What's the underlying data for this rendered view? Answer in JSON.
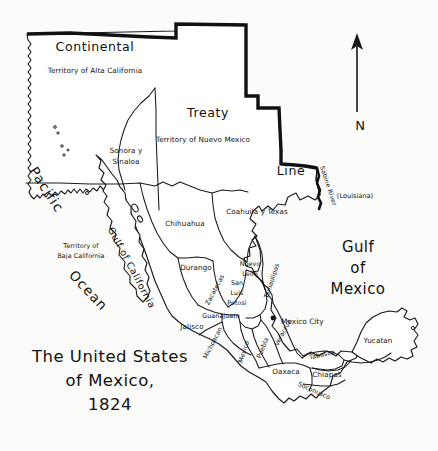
{
  "map": {
    "title_line1": "The United States",
    "title_line2": "of Mexico,",
    "title_year": "1824",
    "background_color": "#fbfbf9",
    "ink_color": "#111111",
    "land_fill": "#ffffff"
  },
  "compass": {
    "label": "N",
    "icon": "north-arrow-icon"
  },
  "boundary_labels": [
    {
      "id": "continental",
      "text": "Continental",
      "x": 95,
      "y": 47
    },
    {
      "id": "treaty",
      "text": "Treaty",
      "x": 208,
      "y": 113
    },
    {
      "id": "line",
      "text": "Line",
      "x": 291,
      "y": 171
    }
  ],
  "water_labels": [
    {
      "id": "pacific",
      "text": "Pacific",
      "x": 46,
      "y": 190,
      "rotate": 57
    },
    {
      "id": "ocean",
      "text": "Ocean",
      "x": 88,
      "y": 291,
      "rotate": 47
    },
    {
      "id": "gulf-of-california",
      "text": "Gulf of California",
      "x": 131,
      "y": 268,
      "rotate": 62
    },
    {
      "id": "gulf-of-mexico-1",
      "text": "Gulf",
      "x": 358,
      "y": 247
    },
    {
      "id": "gulf-of-mexico-2",
      "text": "of",
      "x": 358,
      "y": 267
    },
    {
      "id": "gulf-of-mexico-3",
      "text": "Mexico",
      "x": 358,
      "y": 288
    },
    {
      "id": "sabine-river",
      "text": "Sabine River",
      "x": 326,
      "y": 186,
      "rotate": 72
    }
  ],
  "territories": [
    {
      "id": "alta-california",
      "line1": "Territory of Alta California",
      "x": 95,
      "y": 71
    },
    {
      "id": "nuevo-mexico",
      "line1": "Territory of Nuevo Mexico",
      "x": 203,
      "y": 140
    },
    {
      "id": "baja-california",
      "line1": "Territory of",
      "line2": "Baja California",
      "x": 81,
      "y": 250
    }
  ],
  "states": [
    {
      "id": "sonora-sinaloa",
      "line1": "Sonora y",
      "line2": "Sinaloa",
      "x": 126,
      "y": 155,
      "rotate": 0
    },
    {
      "id": "chihuahua",
      "line1": "Chihuahua",
      "x": 185,
      "y": 224,
      "rotate": 0
    },
    {
      "id": "coahuila-texas",
      "line1": "Coahuila y Texas",
      "x": 257,
      "y": 212,
      "rotate": 0
    },
    {
      "id": "durango",
      "line1": "Durango",
      "x": 196,
      "y": 268,
      "rotate": 0
    },
    {
      "id": "zacatecas",
      "line1": "Zacatecas",
      "x": 215,
      "y": 290,
      "rotate": -62
    },
    {
      "id": "nuevo-leon",
      "line1": "Nuevo",
      "line2": "Leon",
      "x": 250,
      "y": 268,
      "rotate": 0
    },
    {
      "id": "tamaulipas",
      "line1": "Tamaulipas",
      "x": 272,
      "y": 281,
      "rotate": -72
    },
    {
      "id": "san-luis-potosi",
      "line1": "San",
      "line2": "Luis",
      "line3": "Potosi",
      "x": 237,
      "y": 292,
      "rotate": 0
    },
    {
      "id": "guanajuato",
      "line1": "Guanajuato",
      "x": 221,
      "y": 316,
      "rotate": 0
    },
    {
      "id": "jalisco",
      "line1": "Jalisco",
      "x": 192,
      "y": 327,
      "rotate": 0
    },
    {
      "id": "michoacan",
      "line1": "Michoacan",
      "x": 213,
      "y": 343,
      "rotate": -63
    },
    {
      "id": "mexico",
      "line1": "Mexico",
      "x": 244,
      "y": 352,
      "rotate": -72
    },
    {
      "id": "puebla",
      "line1": "Puebla",
      "x": 263,
      "y": 348,
      "rotate": -68
    },
    {
      "id": "veracruz",
      "line1": "Veracruz",
      "x": 283,
      "y": 333,
      "rotate": -62
    },
    {
      "id": "oaxaca",
      "line1": "Oaxaca",
      "x": 286,
      "y": 372,
      "rotate": 0
    },
    {
      "id": "tabasco",
      "line1": "Tabasco",
      "x": 322,
      "y": 355,
      "rotate": -12
    },
    {
      "id": "chiapas",
      "line1": "Chiapas",
      "x": 327,
      "y": 375,
      "rotate": 0
    },
    {
      "id": "soconusco",
      "line1": "Soconusco",
      "x": 314,
      "y": 391,
      "rotate": 24
    },
    {
      "id": "yucatan",
      "line1": "Yucatan",
      "x": 378,
      "y": 341,
      "rotate": 0
    }
  ],
  "foreign_labels": [
    {
      "id": "louisiana",
      "text": "(Louisiana)",
      "x": 355,
      "y": 196
    }
  ],
  "cities": [
    {
      "id": "mexico-city",
      "text": "Mexico City",
      "dot_x": 273,
      "dot_y": 318,
      "label_x": 281,
      "label_y": 322
    }
  ]
}
